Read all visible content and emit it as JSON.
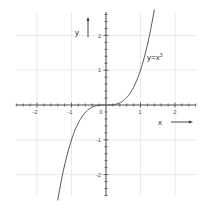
{
  "chart_data": {
    "type": "line",
    "title": "",
    "xlabel": "x",
    "ylabel": "y",
    "xlim": [
      -2.6,
      2.6
    ],
    "ylim": [
      -2.6,
      2.6
    ],
    "grid": true,
    "x_ticks": [
      -2,
      -1,
      0,
      1,
      2
    ],
    "y_ticks": [
      -2,
      -1,
      1,
      2
    ],
    "x_tick_labels": [
      "-2",
      "-1",
      "0",
      "1",
      "2"
    ],
    "y_tick_labels": [
      "-2",
      "-1",
      "1",
      "2"
    ],
    "series": [
      {
        "name": "y=x³",
        "function": "x^3",
        "x": [
          -1.4,
          -1.2,
          -1.0,
          -0.8,
          -0.6,
          -0.4,
          -0.2,
          0,
          0.2,
          0.4,
          0.6,
          0.8,
          1.0,
          1.2,
          1.4
        ],
        "y": [
          -2.744,
          -1.728,
          -1.0,
          -0.512,
          -0.216,
          -0.064,
          -0.008,
          0,
          0.008,
          0.064,
          0.216,
          0.512,
          1.0,
          1.728,
          2.744
        ]
      }
    ],
    "annotations": [
      {
        "text": "y=x",
        "superscript": "3",
        "x": 1.2,
        "y": 1.3
      }
    ],
    "axis_arrows": {
      "x": "→",
      "y": "↑"
    }
  },
  "labels": {
    "x_axis": "x",
    "y_axis": "y",
    "curve_base": "y=x",
    "curve_exp": "3",
    "ticks": {
      "xm2": "-2",
      "xm1": "-1",
      "x0": "0",
      "x1": "1",
      "x2": "2",
      "y2": "2",
      "y1": "1",
      "ym1": "-1",
      "ym2": "-2"
    }
  }
}
